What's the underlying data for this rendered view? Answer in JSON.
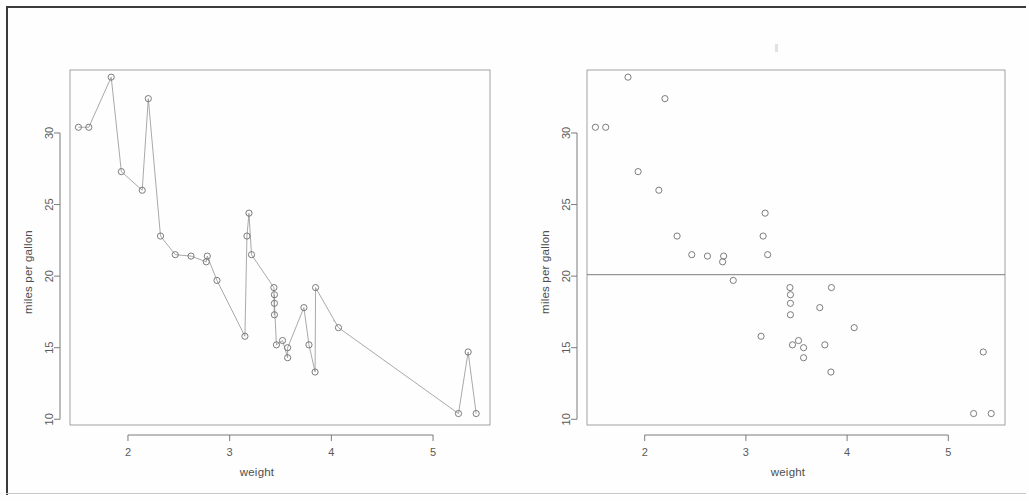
{
  "document": {
    "kind": "scanned-page",
    "background_color": "#fefefe",
    "frame_color": "#3a3a3a"
  },
  "panels": [
    {
      "id": "left",
      "name": "connected-scatter-plot",
      "xlabel": "weight",
      "ylabel": "miles per gallon"
    },
    {
      "id": "right",
      "name": "scatter-plot-with-mean-line",
      "xlabel": "weight",
      "ylabel": "miles per gallon"
    }
  ],
  "chart_data": [
    {
      "type": "line",
      "title": "",
      "subtitle": "",
      "xlabel": "weight",
      "ylabel": "miles per gallon",
      "xlim": [
        1.43,
        5.56
      ],
      "ylim": [
        9.6,
        34.4
      ],
      "xticks": [
        2,
        3,
        4,
        5
      ],
      "yticks": [
        10,
        15,
        20,
        25,
        30
      ],
      "grid": false,
      "legend": null,
      "marker": "open-circle",
      "line_style": "solid",
      "sorted_by": "x",
      "series": [
        {
          "name": "mtcars",
          "x": [
            1.513,
            1.615,
            1.835,
            1.935,
            2.14,
            2.2,
            2.32,
            2.465,
            2.62,
            2.77,
            2.78,
            2.875,
            3.15,
            3.17,
            3.19,
            3.215,
            3.435,
            3.44,
            3.44,
            3.44,
            3.46,
            3.52,
            3.57,
            3.57,
            3.73,
            3.78,
            3.84,
            3.845,
            4.07,
            5.25,
            5.345,
            5.424
          ],
          "y": [
            30.4,
            30.4,
            33.9,
            27.3,
            26.0,
            32.4,
            22.8,
            21.5,
            21.4,
            21.0,
            21.4,
            19.7,
            15.8,
            22.8,
            24.4,
            21.5,
            19.2,
            17.3,
            18.7,
            18.1,
            15.2,
            15.5,
            14.3,
            15.0,
            17.8,
            15.2,
            13.3,
            19.2,
            16.4,
            10.4,
            14.7,
            10.4
          ]
        }
      ]
    },
    {
      "type": "scatter",
      "title": "",
      "subtitle": "",
      "xlabel": "weight",
      "ylabel": "miles per gallon",
      "xlim": [
        1.43,
        5.56
      ],
      "ylim": [
        9.6,
        34.4
      ],
      "xticks": [
        2,
        3,
        4,
        5
      ],
      "yticks": [
        10,
        15,
        20,
        25,
        30
      ],
      "grid": false,
      "legend": null,
      "marker": "open-circle",
      "annotations": [
        {
          "kind": "horizontal-line",
          "label": "mean mpg",
          "value": 20.1
        }
      ],
      "series": [
        {
          "name": "mtcars",
          "x": [
            1.513,
            1.615,
            1.835,
            1.935,
            2.14,
            2.2,
            2.32,
            2.465,
            2.62,
            2.77,
            2.78,
            2.875,
            3.15,
            3.17,
            3.19,
            3.215,
            3.435,
            3.44,
            3.44,
            3.44,
            3.46,
            3.52,
            3.57,
            3.57,
            3.73,
            3.78,
            3.84,
            3.845,
            4.07,
            5.25,
            5.345,
            5.424
          ],
          "y": [
            30.4,
            30.4,
            33.9,
            27.3,
            26.0,
            32.4,
            22.8,
            21.5,
            21.4,
            21.0,
            21.4,
            19.7,
            15.8,
            22.8,
            24.4,
            21.5,
            19.2,
            17.3,
            18.7,
            18.1,
            15.2,
            15.5,
            14.3,
            15.0,
            17.8,
            15.2,
            13.3,
            19.2,
            16.4,
            10.4,
            14.7,
            10.4
          ]
        }
      ]
    }
  ]
}
